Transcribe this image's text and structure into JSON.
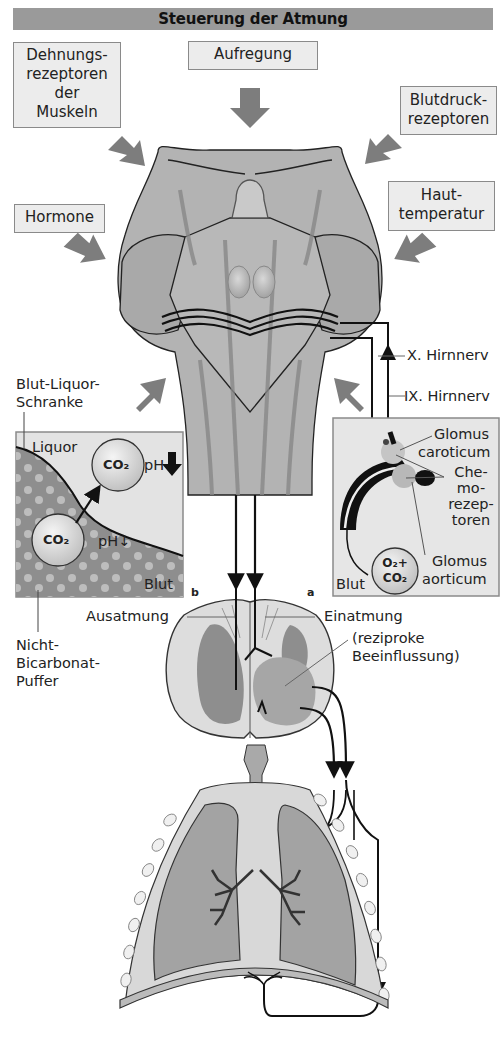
{
  "title": "Steuerung der Atmung",
  "inputs": {
    "dehnungsrezeptoren": [
      "Dehnungs-",
      "rezeptoren",
      "der",
      "Muskeln"
    ],
    "aufregung": "Aufregung",
    "blutdruck": [
      "Blutdruck-",
      "rezeptoren"
    ],
    "hormone": "Hormone",
    "hauttemperatur": [
      "Haut-",
      "temperatur"
    ]
  },
  "nerves": {
    "vagus": "X. Hirnnerv",
    "glossopharyngeus": "IX. Hirnnerv"
  },
  "panel_b": {
    "barrier_label": [
      "Blut-Liquor-",
      "Schranke"
    ],
    "liquor": "Liquor",
    "blut": "Blut",
    "co2_top": "CO₂",
    "co2_bottom": "CO₂",
    "ph_top": "pH",
    "ph_bottom": "pH↓",
    "letter": "b",
    "buffer_label": [
      "Nicht-",
      "Bicarbonat-",
      "Puffer"
    ]
  },
  "panel_a": {
    "glomus_caroticum": [
      "Glomus",
      "caroticum"
    ],
    "chemorezeptoren": [
      "Che-",
      "mo-",
      "rezep-",
      "toren"
    ],
    "glomus_aorticum": [
      "Glomus",
      "aorticum"
    ],
    "blut": "Blut",
    "gas_top": "O₂+",
    "gas_bottom": "CO₂",
    "letter": "a"
  },
  "spinal": {
    "ausatmung": "Ausatmung",
    "einatmung": "Einatmung",
    "reziprok": [
      "(reziproke",
      "Beeinflussung)"
    ]
  },
  "colors": {
    "title_bar": "#9a9a9a",
    "box_fill": "#ececec",
    "arrow": "#7d7d7d",
    "tissue_dark": "#8c8c8c",
    "tissue_mid": "#a8a8a8",
    "tissue_light": "#c4c4c4"
  }
}
